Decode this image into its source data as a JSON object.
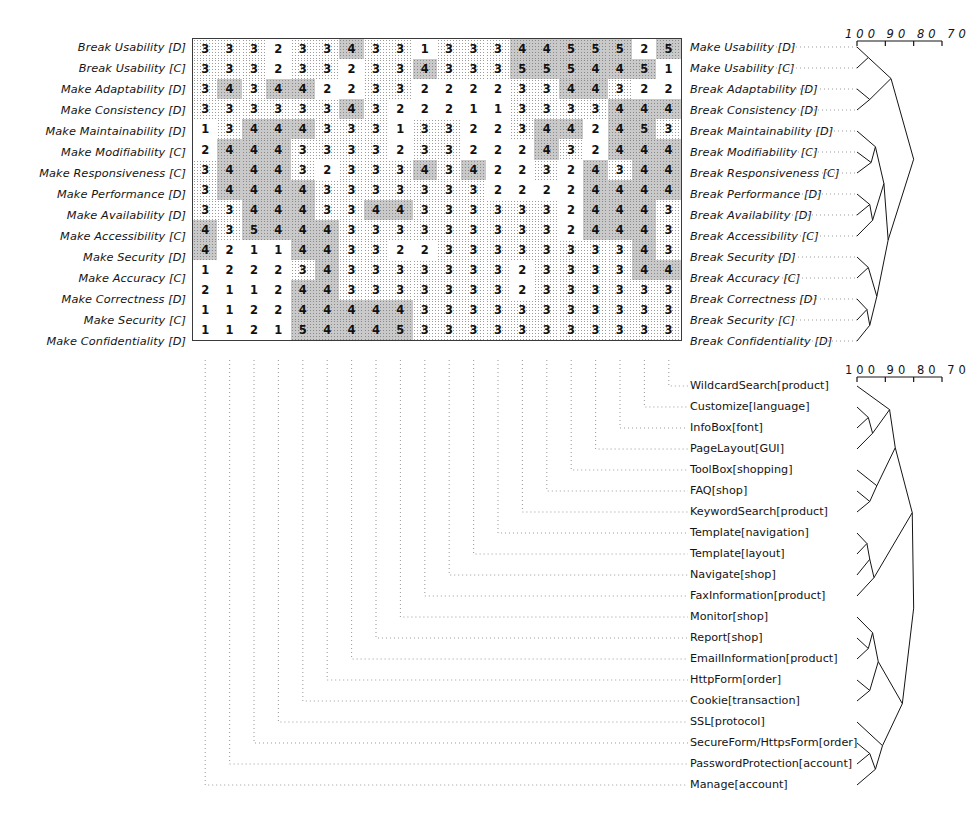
{
  "figure": {
    "type": "clustered-matrix-dendrogram",
    "background": "#ffffff",
    "ink": "#141414"
  },
  "scales": {
    "top": {
      "ticks": [
        "100",
        "90",
        "80",
        "70"
      ],
      "label_text": "100 90 80 70"
    },
    "bottom": {
      "ticks": [
        "100",
        "90",
        "80",
        "70"
      ],
      "label_text": "100 90 80 70"
    }
  },
  "matrix": {
    "rows": 15,
    "cols": 20,
    "row_labels_left": [
      "Break Usability [D]",
      "Break Usability [C]",
      "Make Adaptability [D]",
      "Make Consistency [D]",
      "Make Maintainability [D]",
      "Make Modifiability [C]",
      "Make Responsiveness [C]",
      "Make Performance [D]",
      "Make Availability [D]",
      "Make Accessibility [C]",
      "Make Security [D]",
      "Make Accuracy [C]",
      "Make Correctness [D]",
      "Make Security [C]",
      "Make Confidentiality [D]"
    ],
    "row_labels_right": [
      "Make Usability [D]",
      "Make Usability [C]",
      "Break Adaptability [D]",
      "Break Consistency [D]",
      "Break Maintainability [D]",
      "Break Modifiability [C]",
      "Break Responsiveness [C]",
      "Break Performance [D]",
      "Break Availability [D]",
      "Break Accessibility [C]",
      "Break Security [D]",
      "Break Accuracy [C]",
      "Break Correctness [D]",
      "Break Security [C]",
      "Break Confidentiality [D]"
    ],
    "col_labels": [
      "WildcardSearch[product]",
      "Customize[language]",
      "InfoBox[font]",
      "PageLayout[GUI]",
      "ToolBox[shopping]",
      "FAQ[shop]",
      "KeywordSearch[product]",
      "Template[navigation]",
      "Template[layout]",
      "Navigate[shop]",
      "FaxInformation[product]",
      "Monitor[shop]",
      "Report[shop]",
      "EmailInformation[product]",
      "HttpForm[order]",
      "Cookie[transaction]",
      "SSL[protocol]",
      "SecureForm/HttpsForm[order]",
      "PasswordProtection[account]",
      "Manage[account]"
    ],
    "values": [
      [
        3,
        3,
        3,
        2,
        3,
        3,
        4,
        3,
        3,
        1,
        3,
        3,
        3,
        4,
        4,
        5,
        5,
        5,
        2,
        5
      ],
      [
        3,
        3,
        3,
        2,
        3,
        3,
        2,
        3,
        3,
        4,
        3,
        3,
        3,
        5,
        5,
        5,
        4,
        4,
        5,
        1
      ],
      [
        3,
        4,
        3,
        4,
        4,
        2,
        2,
        3,
        3,
        2,
        2,
        2,
        2,
        3,
        3,
        4,
        4,
        3,
        2,
        2
      ],
      [
        3,
        3,
        3,
        3,
        3,
        3,
        4,
        3,
        2,
        2,
        2,
        1,
        1,
        3,
        3,
        3,
        3,
        4,
        4,
        4
      ],
      [
        1,
        3,
        4,
        4,
        4,
        3,
        3,
        3,
        1,
        3,
        3,
        2,
        2,
        3,
        4,
        4,
        2,
        4,
        5,
        3
      ],
      [
        2,
        4,
        4,
        4,
        3,
        3,
        3,
        3,
        2,
        3,
        3,
        2,
        2,
        2,
        4,
        3,
        2,
        4,
        4,
        4
      ],
      [
        3,
        4,
        4,
        4,
        3,
        2,
        3,
        3,
        3,
        4,
        3,
        4,
        2,
        2,
        3,
        2,
        4,
        3,
        4,
        4
      ],
      [
        3,
        4,
        4,
        4,
        4,
        3,
        3,
        3,
        3,
        3,
        3,
        3,
        2,
        2,
        2,
        2,
        4,
        4,
        4,
        4
      ],
      [
        3,
        3,
        4,
        4,
        4,
        3,
        3,
        4,
        4,
        3,
        3,
        3,
        3,
        3,
        3,
        2,
        4,
        4,
        4,
        3
      ],
      [
        4,
        3,
        5,
        4,
        4,
        4,
        3,
        3,
        3,
        3,
        3,
        3,
        3,
        3,
        3,
        2,
        4,
        4,
        4,
        3
      ],
      [
        4,
        2,
        1,
        1,
        4,
        4,
        3,
        3,
        2,
        2,
        3,
        3,
        3,
        3,
        3,
        3,
        3,
        3,
        4,
        3
      ],
      [
        1,
        2,
        2,
        2,
        3,
        4,
        3,
        3,
        3,
        3,
        3,
        3,
        3,
        2,
        3,
        3,
        3,
        3,
        4,
        4
      ],
      [
        2,
        1,
        1,
        2,
        4,
        4,
        3,
        3,
        3,
        3,
        3,
        3,
        3,
        2,
        3,
        3,
        3,
        3,
        3,
        3
      ],
      [
        1,
        1,
        2,
        2,
        4,
        4,
        4,
        4,
        4,
        3,
        3,
        3,
        3,
        3,
        3,
        3,
        3,
        3,
        3,
        3
      ],
      [
        1,
        1,
        2,
        1,
        5,
        4,
        4,
        4,
        5,
        3,
        3,
        3,
        3,
        3,
        3,
        3,
        3,
        3,
        3,
        3
      ]
    ],
    "shading_legend": {
      "plain": "white cell",
      "light": "fine dotted cell",
      "dark": "dense grey dotted cell"
    },
    "shading": [
      [
        1,
        1,
        1,
        0,
        1,
        1,
        2,
        1,
        1,
        0,
        1,
        1,
        1,
        2,
        2,
        2,
        2,
        2,
        0,
        2
      ],
      [
        1,
        1,
        1,
        0,
        1,
        1,
        0,
        1,
        1,
        2,
        1,
        1,
        1,
        2,
        2,
        2,
        2,
        2,
        2,
        0
      ],
      [
        1,
        2,
        1,
        2,
        2,
        0,
        0,
        1,
        1,
        0,
        0,
        0,
        0,
        1,
        1,
        2,
        2,
        1,
        0,
        0
      ],
      [
        1,
        1,
        1,
        1,
        1,
        1,
        2,
        1,
        0,
        0,
        0,
        0,
        0,
        1,
        1,
        1,
        1,
        2,
        2,
        2
      ],
      [
        0,
        1,
        2,
        2,
        2,
        1,
        1,
        1,
        0,
        1,
        1,
        0,
        0,
        1,
        2,
        2,
        0,
        2,
        2,
        1
      ],
      [
        0,
        2,
        2,
        2,
        1,
        1,
        1,
        1,
        0,
        1,
        1,
        0,
        0,
        0,
        2,
        1,
        0,
        2,
        2,
        2
      ],
      [
        1,
        2,
        2,
        2,
        1,
        0,
        1,
        1,
        1,
        2,
        1,
        2,
        0,
        0,
        1,
        0,
        2,
        1,
        2,
        2
      ],
      [
        1,
        2,
        2,
        2,
        2,
        1,
        1,
        1,
        1,
        1,
        1,
        1,
        0,
        0,
        0,
        0,
        2,
        2,
        2,
        2
      ],
      [
        1,
        1,
        2,
        2,
        2,
        1,
        1,
        2,
        2,
        1,
        1,
        1,
        1,
        1,
        1,
        0,
        2,
        2,
        2,
        1
      ],
      [
        2,
        1,
        2,
        2,
        2,
        2,
        1,
        1,
        1,
        1,
        1,
        1,
        1,
        1,
        1,
        0,
        2,
        2,
        2,
        1
      ],
      [
        2,
        0,
        0,
        0,
        2,
        2,
        1,
        1,
        0,
        0,
        1,
        1,
        1,
        1,
        1,
        1,
        1,
        1,
        2,
        1
      ],
      [
        0,
        0,
        0,
        0,
        1,
        2,
        1,
        1,
        1,
        1,
        1,
        1,
        1,
        0,
        1,
        1,
        1,
        1,
        2,
        2
      ],
      [
        0,
        0,
        0,
        0,
        2,
        2,
        1,
        1,
        1,
        1,
        1,
        1,
        1,
        0,
        1,
        1,
        1,
        1,
        1,
        1
      ],
      [
        0,
        0,
        0,
        0,
        2,
        2,
        2,
        2,
        2,
        1,
        1,
        1,
        1,
        1,
        1,
        1,
        1,
        1,
        1,
        1
      ],
      [
        0,
        0,
        0,
        0,
        2,
        2,
        2,
        2,
        2,
        1,
        1,
        1,
        1,
        1,
        1,
        1,
        1,
        1,
        1,
        1
      ]
    ]
  }
}
